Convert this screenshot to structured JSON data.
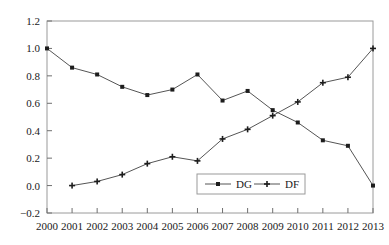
{
  "chart_data": {
    "type": "line",
    "title": "",
    "xlabel": "",
    "ylabel": "",
    "x": [
      2000,
      2001,
      2002,
      2003,
      2004,
      2005,
      2006,
      2007,
      2008,
      2009,
      2010,
      2011,
      2012,
      2013
    ],
    "categories": [
      "2000",
      "2001",
      "2002",
      "2003",
      "2004",
      "2005",
      "2006",
      "2007",
      "2008",
      "2009",
      "2010",
      "2011",
      "2012",
      "2013"
    ],
    "xlim": [
      2000,
      2013
    ],
    "ylim": [
      -0.2,
      1.2
    ],
    "y_ticks": [
      -0.2,
      0.0,
      0.2,
      0.4,
      0.6,
      0.8,
      1.0,
      1.2
    ],
    "y_tick_labels": [
      "-0.2",
      "0.0",
      "0.2",
      "0.4",
      "0.6",
      "0.8",
      "1.0",
      "1.2"
    ],
    "x_tick_labels": [
      "2000",
      "2001",
      "2002",
      "2003",
      "2004",
      "2005",
      "2006",
      "2007",
      "2008",
      "2009",
      "2010",
      "2011",
      "2012",
      "2013"
    ],
    "grid": false,
    "legend_position": "bottom-center",
    "series": [
      {
        "name": "DG",
        "marker": "filled-square",
        "color": "#555555",
        "x": [
          2000,
          2001,
          2002,
          2003,
          2004,
          2005,
          2006,
          2007,
          2008,
          2009,
          2010,
          2011,
          2012,
          2013
        ],
        "values": [
          1.0,
          0.86,
          0.81,
          0.72,
          0.66,
          0.7,
          0.81,
          0.62,
          0.69,
          0.55,
          0.46,
          0.33,
          0.29,
          0.0
        ]
      },
      {
        "name": "DF",
        "marker": "filled-cross",
        "color": "#555555",
        "x": [
          2001,
          2002,
          2003,
          2004,
          2005,
          2006,
          2007,
          2008,
          2009,
          2010,
          2011,
          2012,
          2013
        ],
        "values": [
          0.0,
          0.03,
          0.08,
          0.16,
          0.21,
          0.18,
          0.34,
          0.41,
          0.51,
          0.61,
          0.75,
          0.79,
          1.0
        ]
      }
    ],
    "legend_entries": [
      {
        "label": "DG",
        "marker": "filled-square"
      },
      {
        "label": "DF",
        "marker": "filled-cross"
      }
    ],
    "colors": {
      "line": "#555555",
      "marker": "#1d1d1d",
      "frame": "#9a9a9a",
      "text": "#1a1a1a",
      "background": "#ffffff"
    }
  }
}
